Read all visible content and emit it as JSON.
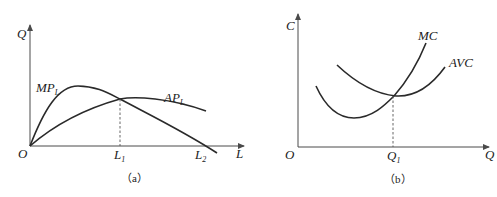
{
  "figures": [
    {
      "id": "a",
      "caption": "（a）",
      "y_axis_label": "Q",
      "x_axis_label": "L",
      "origin_label": "O",
      "curves": [
        {
          "name": "MP",
          "subscript": "L",
          "shape": "rises from origin, peaks, then falls crossing the L axis at L2"
        },
        {
          "name": "AP",
          "subscript": "L",
          "shape": "rises from origin, peaks at L1 where it meets MP, then declines slowly"
        }
      ],
      "x_ticks": [
        {
          "label": "L",
          "subscript": "1",
          "note": "dashed line up to MP = AP intersection"
        },
        {
          "label": "L",
          "subscript": "2",
          "note": "MP crosses zero"
        }
      ]
    },
    {
      "id": "b",
      "caption": "（b）",
      "y_axis_label": "C",
      "x_axis_label": "Q",
      "origin_label": "O",
      "curves": [
        {
          "name": "MC",
          "shape": "U-shaped, minimum left of Q1, rises through AVC minimum"
        },
        {
          "name": "AVC",
          "shape": "U-shaped, minimum at Q1 where MC intersects"
        }
      ],
      "x_ticks": [
        {
          "label": "Q",
          "subscript": "1",
          "note": "dashed line up to MC = AVC intersection"
        }
      ]
    }
  ]
}
